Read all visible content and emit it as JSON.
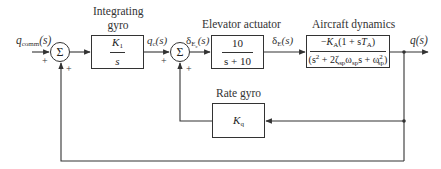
{
  "diagram": {
    "type": "control-block-diagram",
    "input": {
      "symbol": "q",
      "subscript": "comm",
      "arg": "(s)"
    },
    "output": {
      "symbol": "q",
      "arg": "(s)"
    },
    "summing_junctions": [
      {
        "id": "sum1",
        "symbol": "Σ",
        "signs": [
          "+",
          "+"
        ]
      },
      {
        "id": "sum2",
        "symbol": "Σ",
        "signs": [
          "+",
          "+"
        ]
      }
    ],
    "blocks": [
      {
        "id": "integrating-gyro",
        "title_line1": "Integrating",
        "title_line2": "gyro",
        "numerator_sym": "K",
        "numerator_sub": "1",
        "denominator": "s"
      },
      {
        "id": "elevator-actuator",
        "title": "Elevator actuator",
        "numerator": "10",
        "denominator": "s + 10"
      },
      {
        "id": "aircraft-dynamics",
        "title": "Aircraft dynamics",
        "numerator": "−K_A(1 + sT_A)",
        "denominator": "(s² + 2ζ_sp ω_sp s + ω²_sp)"
      },
      {
        "id": "rate-gyro",
        "title": "Rate gyro",
        "gain_sym": "K",
        "gain_sub": "q"
      }
    ],
    "signals": [
      {
        "id": "qc",
        "symbol": "q",
        "subscript": "c",
        "arg": "(s)"
      },
      {
        "id": "dEc",
        "symbol": "δ",
        "subscript": "E",
        "subsub": "c",
        "arg": "(s)"
      },
      {
        "id": "dE",
        "symbol": "δ",
        "subscript": "E",
        "arg": "(s)"
      }
    ],
    "text": {
      "plus": "+",
      "sigma": "Σ",
      "minus": "−",
      "K": "K",
      "A": "A",
      "one_plus_s": "(1 + s",
      "T": "T",
      "close_paren": ")",
      "s2_plus_2": "(s",
      "two": "2",
      "plus_2": " + 2",
      "zeta": "ζ",
      "omega": "ω",
      "sp": "sp",
      "s_plus": "s + ",
      "omega_end": ")"
    }
  }
}
